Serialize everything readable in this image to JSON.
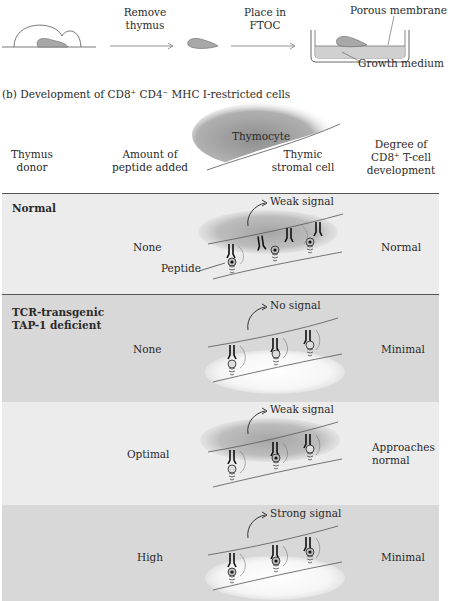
{
  "panel_a": {
    "step1_label": [
      "Remove",
      "thymus"
    ],
    "step2_label": [
      "Place in",
      "FTOC"
    ],
    "porous_membrane_label": "Porous membrane",
    "growth_medium_label": "Growth medium"
  },
  "panel_b": {
    "title": "(b) Development of CD8⁺ CD4⁻ MHC I-restricted cells",
    "headers": {
      "donor": [
        "Thymus",
        "donor"
      ],
      "peptide": [
        "Amount of",
        "peptide added"
      ],
      "thymocyte": "Thymocyte",
      "stromal": [
        "Thymic",
        "stromal cell"
      ],
      "degree": [
        "Degree of",
        "CD8⁺ T-cell",
        "development"
      ]
    },
    "peptide_callout": "Peptide",
    "rows": [
      {
        "donor": [
          "Normal"
        ],
        "peptide": "None",
        "signal": "Weak signal",
        "degree": [
          "Normal"
        ],
        "shade": "light"
      },
      {
        "donor": [
          "TCR-transgenic",
          "TAP-1 deficient"
        ],
        "peptide": "None",
        "signal": "No signal",
        "degree": [
          "Minimal"
        ],
        "shade": "dark"
      },
      {
        "donor": [
          ""
        ],
        "peptide": "Optimal",
        "signal": "Weak signal",
        "degree": [
          "Approaches",
          "normal"
        ],
        "shade": "light"
      },
      {
        "donor": [
          ""
        ],
        "peptide": "High",
        "signal": "Strong signal",
        "degree": [
          "Minimal"
        ],
        "shade": "dark"
      }
    ]
  },
  "colors": {
    "row_light": "#ececec",
    "row_dark": "#d8d8d8",
    "thymocyte_fill": "#9a9a9a",
    "line": "#555555"
  }
}
